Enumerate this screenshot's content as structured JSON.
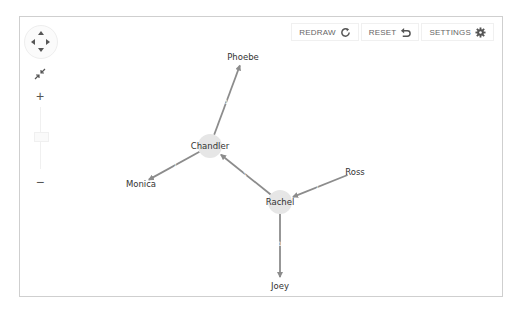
{
  "toolbar": {
    "redraw_label": "REDRAW",
    "reset_label": "RESET",
    "settings_label": "SETTINGS",
    "redraw_icon": "refresh-icon",
    "reset_icon": "undo-icon",
    "settings_icon": "gear-icon"
  },
  "navigation": {
    "pan_icon": "pan-arrows-icon",
    "fit_icon": "fit-to-screen-icon",
    "zoom_in_label": "+",
    "zoom_out_label": "−"
  },
  "graph": {
    "nodes": [
      {
        "id": "phoebe",
        "label": "Phoebe",
        "x": 243,
        "y": 57,
        "bubble": false
      },
      {
        "id": "chandler",
        "label": "Chandler",
        "x": 210,
        "y": 146,
        "bubble": true
      },
      {
        "id": "monica",
        "label": "Monica",
        "x": 141,
        "y": 184,
        "bubble": false
      },
      {
        "id": "rachel",
        "label": "Rachel",
        "x": 280,
        "y": 202,
        "bubble": true
      },
      {
        "id": "ross",
        "label": "Ross",
        "x": 355,
        "y": 172,
        "bubble": false
      },
      {
        "id": "joey",
        "label": "Joey",
        "x": 280,
        "y": 286,
        "bubble": false
      }
    ],
    "edges": [
      {
        "from": "chandler",
        "to": "phoebe",
        "label": "1"
      },
      {
        "from": "chandler",
        "to": "monica",
        "label": "1"
      },
      {
        "from": "rachel",
        "to": "chandler",
        "label": "1"
      },
      {
        "from": "ross",
        "to": "rachel",
        "label": "1"
      },
      {
        "from": "rachel",
        "to": "joey",
        "label": "1"
      }
    ],
    "colors": {
      "edge": "#8c8c8c",
      "node_bubble": "#e6e6e6",
      "label": "#333333"
    }
  }
}
